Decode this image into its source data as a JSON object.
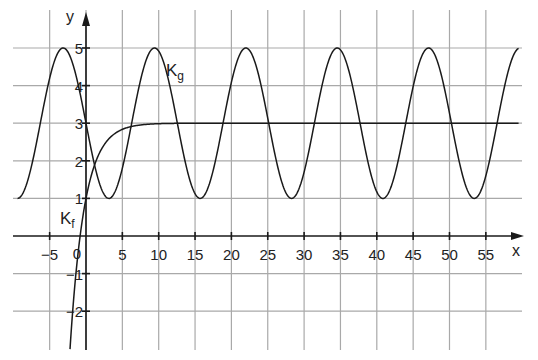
{
  "chart_data": {
    "type": "line",
    "title": "",
    "xlabel": "x",
    "ylabel": "y",
    "xlim": [
      -10,
      59.5
    ],
    "ylim": [
      -3,
      6
    ],
    "grid": true,
    "x_ticks": [
      -5,
      0,
      5,
      10,
      15,
      20,
      25,
      30,
      35,
      40,
      45,
      50,
      55
    ],
    "x_tick_labels": [
      "−5",
      "0",
      "5",
      "10",
      "15",
      "20",
      "25",
      "30",
      "35",
      "40",
      "45",
      "50",
      "55"
    ],
    "y_ticks": [
      -2,
      -1,
      1,
      2,
      3,
      4,
      5
    ],
    "y_tick_labels": [
      "−2",
      "−1",
      "1",
      "2",
      "3",
      "4",
      "5"
    ],
    "origin_label": "0",
    "series": [
      {
        "name": "K_f",
        "label_main": "K",
        "label_sub": "f",
        "formula": "3 - 2*exp(-0.5*x)",
        "description": "Logistic-like saturating curve, f(0)=1, asymptote y=3",
        "key_points": [
          [
            -2.2,
            -3.0
          ],
          [
            -0.81,
            0
          ],
          [
            0,
            1
          ],
          [
            1.6,
            2.1
          ],
          [
            5,
            2.84
          ],
          [
            10,
            2.99
          ],
          [
            59.5,
            3.0
          ]
        ],
        "x_range": [
          -2.2,
          59.5
        ]
      },
      {
        "name": "K_g",
        "label_main": "K",
        "label_sub": "g",
        "formula": "3 - 2*sin(0.5*x)",
        "description": "Sinusoid, amplitude 2, midline 3, period 4π",
        "maxima_x": [
          -3.14,
          9.42,
          21.99,
          34.56,
          47.12,
          59.69
        ],
        "minima_x": [
          3.14,
          15.71,
          28.27,
          40.84,
          53.41
        ],
        "max_value": 5,
        "min_value": 1,
        "key_points": [
          [
            -9.42,
            1
          ],
          [
            -3.14,
            5
          ],
          [
            0,
            3
          ],
          [
            3.14,
            1
          ],
          [
            9.42,
            5
          ],
          [
            15.71,
            1
          ],
          [
            21.99,
            5
          ],
          [
            28.27,
            1
          ],
          [
            34.56,
            5
          ],
          [
            40.84,
            1
          ],
          [
            47.12,
            5
          ],
          [
            53.41,
            1
          ],
          [
            59.5,
            5
          ]
        ],
        "x_range": [
          -9.42,
          59.5
        ]
      }
    ]
  },
  "layout": {
    "origin_px": [
      86,
      236
    ],
    "px_per_unit_x": 7.27,
    "px_per_unit_y": 37.6,
    "grid_left_px": 13,
    "grid_right_px": 522,
    "grid_top_px": 10,
    "grid_bottom_px": 350,
    "axis_x_end_px": 524,
    "axis_y_top_px": 12,
    "colors": {
      "grid": "#a9a9a9",
      "ink": "#1a1a1a",
      "background": "#ffffff"
    }
  }
}
